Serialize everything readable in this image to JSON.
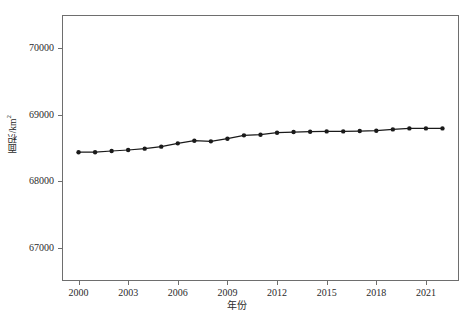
{
  "chart_data": {
    "type": "line",
    "title": "",
    "xlabel": "年份",
    "ylabel": "面积/km²",
    "ylabel_main": "面积/km",
    "ylabel_sup": "2",
    "xlim": [
      1999,
      2023
    ],
    "ylim": [
      66500,
      70500
    ],
    "grid": false,
    "legend": null,
    "marker": "filled-circle",
    "line_color": "#1a1a1a",
    "x": [
      2000,
      2001,
      2002,
      2003,
      2004,
      2005,
      2006,
      2007,
      2008,
      2009,
      2010,
      2011,
      2012,
      2013,
      2014,
      2015,
      2016,
      2017,
      2018,
      2019,
      2020,
      2021,
      2022
    ],
    "values": [
      68437,
      68437,
      68455,
      68470,
      68490,
      68520,
      68570,
      68610,
      68600,
      68640,
      68690,
      68700,
      68730,
      68740,
      68745,
      68750,
      68750,
      68755,
      68760,
      68780,
      68795,
      68795,
      68795
    ],
    "yticks": [
      67000,
      68000,
      69000,
      70000
    ],
    "ytick_labels": [
      "67000",
      "68000",
      "69000",
      "70000"
    ],
    "xticks": [
      2000,
      2003,
      2006,
      2009,
      2012,
      2015,
      2018,
      2021
    ],
    "xtick_labels": [
      "2000",
      "2003",
      "2006",
      "2009",
      "2012",
      "2015",
      "2018",
      "2021"
    ]
  }
}
